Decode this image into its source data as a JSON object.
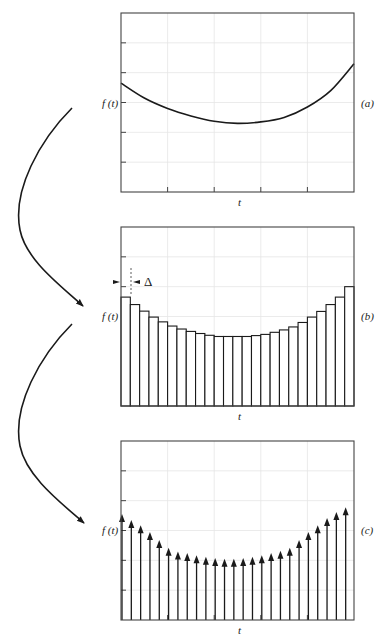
{
  "figure": {
    "colors": {
      "ink": "#1a1a1a",
      "grid": "#e6e6e6",
      "frame": "#444444"
    },
    "transition_arrows": [
      {
        "from": "a",
        "to": "b"
      },
      {
        "from": "b",
        "to": "c"
      }
    ]
  },
  "panels": [
    {
      "id": "a",
      "tag": "(a)",
      "ylabel": "f (t)",
      "xlabel": "t",
      "kind": "continuous curve",
      "box": {
        "x": 121,
        "y": 13,
        "w": 233,
        "h": 179
      }
    },
    {
      "id": "b",
      "tag": "(b)",
      "ylabel": "f (t)",
      "xlabel": "t",
      "kind": "staircase approximation",
      "annotation": "Δ",
      "box": {
        "x": 121,
        "y": 227,
        "w": 233,
        "h": 179
      }
    },
    {
      "id": "c",
      "tag": "(c)",
      "ylabel": "f (t)",
      "xlabel": "t",
      "kind": "impulse train",
      "box": {
        "x": 121,
        "y": 441,
        "w": 233,
        "h": 179
      }
    }
  ],
  "chart_data": [
    {
      "type": "line",
      "title": "(a)",
      "xlabel": "t",
      "ylabel": "f(t)",
      "grid": true,
      "x_divisions": 5,
      "y_divisions": 6,
      "ylim": [
        0,
        6
      ],
      "x": [
        0,
        0.5,
        1,
        1.5,
        2,
        2.5,
        3,
        3.5,
        4,
        4.5,
        5
      ],
      "values": [
        3.65,
        3.15,
        2.8,
        2.55,
        2.37,
        2.3,
        2.35,
        2.5,
        2.85,
        3.4,
        4.3
      ]
    },
    {
      "type": "bar",
      "title": "(b)",
      "xlabel": "t",
      "ylabel": "f(t)",
      "annotation": "Δ (bar width)",
      "grid": true,
      "ylim": [
        0,
        6
      ],
      "bar_count": 25,
      "values": [
        3.65,
        3.4,
        3.18,
        2.98,
        2.82,
        2.68,
        2.58,
        2.5,
        2.43,
        2.37,
        2.33,
        2.33,
        2.33,
        2.33,
        2.36,
        2.4,
        2.47,
        2.55,
        2.65,
        2.8,
        2.98,
        3.17,
        3.4,
        3.65,
        4.0
      ]
    },
    {
      "type": "bar",
      "title": "(c)",
      "xlabel": "t",
      "ylabel": "f(t)",
      "grid": true,
      "ylim": [
        0,
        6
      ],
      "impulse_count": 25,
      "values": [
        3.55,
        3.35,
        3.18,
        2.95,
        2.68,
        2.42,
        2.3,
        2.25,
        2.17,
        2.12,
        2.08,
        2.05,
        2.05,
        2.08,
        2.12,
        2.17,
        2.25,
        2.32,
        2.42,
        2.68,
        2.95,
        3.18,
        3.42,
        3.62,
        3.78
      ]
    }
  ]
}
